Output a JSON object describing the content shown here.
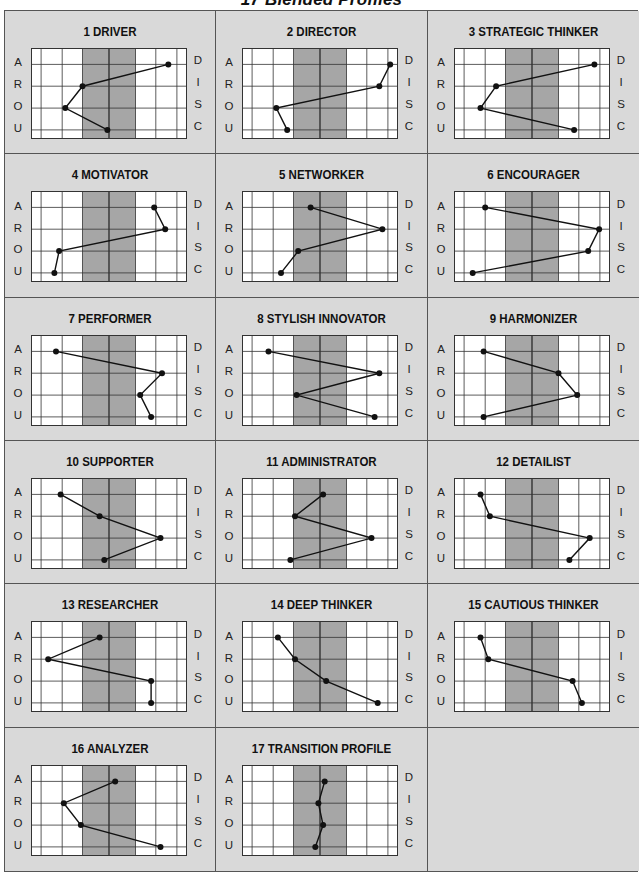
{
  "page": {
    "title": "17 Blended Profiles"
  },
  "axis": {
    "left_labels": [
      "A",
      "R",
      "O",
      "U"
    ],
    "right_labels": [
      "D",
      "I",
      "S",
      "C"
    ]
  },
  "colors": {
    "background": "#d9d9d9",
    "plot_bg": "#ffffff",
    "midband": "#a6a6a6",
    "line": "#111111",
    "grid": "#333333"
  },
  "chart_data": {
    "type": "line",
    "title": "17 Blended Profiles",
    "xlabel": "",
    "ylabel": "",
    "categories": [
      "D",
      "I",
      "S",
      "C"
    ],
    "x_range": [
      0,
      100
    ],
    "midline": 50,
    "shaded_band": [
      33,
      67
    ],
    "note": "Values are horizontal positions (0=left edge, 100=right edge, 50=center line) for each DISC factor",
    "series": [
      {
        "name": "1 DRIVER",
        "values": [
          88,
          33,
          22,
          49
        ]
      },
      {
        "name": "2 DIRECTOR",
        "values": [
          95,
          88,
          22,
          29
        ]
      },
      {
        "name": "3 STRATEGIC THINKER",
        "values": [
          90,
          27,
          17,
          77
        ]
      },
      {
        "name": "4 MOTIVATOR",
        "values": [
          79,
          86,
          18,
          15
        ]
      },
      {
        "name": "5 NETWORKER",
        "values": [
          44,
          90,
          36,
          25
        ]
      },
      {
        "name": "6 ENCOURAGER",
        "values": [
          20,
          93,
          86,
          12
        ]
      },
      {
        "name": "7 PERFORMER",
        "values": [
          16,
          84,
          70,
          77
        ]
      },
      {
        "name": "8 STYLISH INNOVATOR",
        "values": [
          17,
          88,
          35,
          85
        ]
      },
      {
        "name": "9 HARMONIZER",
        "values": [
          19,
          67,
          79,
          19
        ]
      },
      {
        "name": "10 SUPPORTER",
        "values": [
          19,
          44,
          83,
          47
        ]
      },
      {
        "name": "11 ADMINISTRATOR",
        "values": [
          52,
          34,
          83,
          31
        ]
      },
      {
        "name": "12 DETAILIST",
        "values": [
          17,
          23,
          87,
          74
        ]
      },
      {
        "name": "13 RESEARCHER",
        "values": [
          44,
          11,
          77,
          77
        ]
      },
      {
        "name": "14 DEEP THINKER",
        "values": [
          23,
          34,
          54,
          87
        ]
      },
      {
        "name": "15 CAUTIOUS THINKER",
        "values": [
          17,
          22,
          76,
          82
        ]
      },
      {
        "name": "16 ANALYZER",
        "values": [
          54,
          21,
          32,
          83
        ]
      },
      {
        "name": "17 TRANSITION PROFILE",
        "values": [
          53,
          49,
          52,
          47
        ]
      }
    ]
  }
}
